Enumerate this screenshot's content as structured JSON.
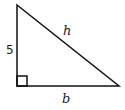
{
  "diagram": {
    "type": "right-triangle",
    "vertices": {
      "top": [
        17,
        5
      ],
      "right_angle": [
        17,
        86
      ],
      "bottom_right": [
        119,
        86
      ]
    },
    "right_angle_marker_size": 10,
    "stroke_color": "#111111",
    "labels": {
      "vertical_leg": "5",
      "hypotenuse": "h",
      "base": "b"
    }
  }
}
